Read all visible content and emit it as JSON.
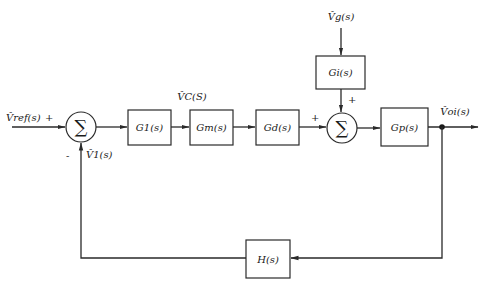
{
  "diagram": {
    "type": "control-system-block-diagram",
    "colors": {
      "stroke": "#2a2a2a",
      "background": "#ffffff"
    },
    "signals": {
      "input": "V̂ref(s)",
      "control": "V̂C(S)",
      "disturbance": "V̂g(s)",
      "output": "V̂oi(s)",
      "feedback": "V̂1(s)"
    },
    "blocks": {
      "g1": "G1(s)",
      "gm": "Gm(s)",
      "gd": "Gd(s)",
      "gi": "Gi(s)",
      "gp": "Gp(s)",
      "h": "H(s)"
    },
    "summers": {
      "s1": {
        "symbol": "∑",
        "plus": "+",
        "minus": "-"
      },
      "s2": {
        "symbol": "∑",
        "plus_left": "+",
        "plus_top": "+"
      }
    },
    "connections": [
      "V̂ref(s) -> Σ1 (+)",
      "Σ1 -> G1(s)",
      "G1(s) -> Gm(s)",
      "Gm(s) -> Gd(s)",
      "Gd(s) -> Σ2 (+)",
      "V̂g(s) -> Gi(s) -> Σ2 (+)",
      "Σ2 -> Gp(s)",
      "Gp(s) -> V̂oi(s)",
      "V̂oi(s) -> H(s) -> Σ1 (-)"
    ]
  }
}
